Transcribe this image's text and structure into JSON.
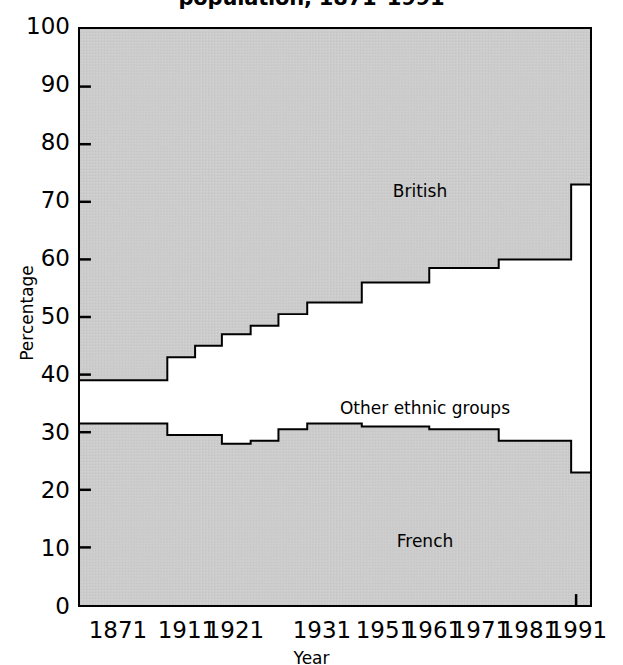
{
  "chart": {
    "title": "population, 1871–1991",
    "y_axis_title": "Percentage",
    "x_axis_title": "Year",
    "y_ticks": [
      "100",
      "90",
      "80",
      "70",
      "60",
      "50",
      "40",
      "30",
      "20",
      "10",
      "0"
    ],
    "x_ticks": [
      "1871",
      "1911",
      "1921",
      "1931",
      "1951",
      "1961",
      "1971",
      "1981",
      "1991"
    ],
    "labels": {
      "british": "British",
      "other": "Other ethnic groups",
      "french": "French"
    },
    "colors": {
      "band_fill": "#cccccc",
      "band_stroke": "#000000",
      "middle_fill": "#ffffff",
      "axis": "#000000",
      "text": "#000000"
    }
  },
  "chart_data": {
    "type": "area",
    "title": "population, 1871–1991",
    "subtitle": "",
    "xlabel": "Year",
    "ylabel": "Percentage",
    "ylim": [
      0,
      100
    ],
    "xlim": [
      1871,
      1991
    ],
    "grid": false,
    "legend_position": "in-plot annotations",
    "stacked": true,
    "step_style": "post",
    "note": "Stacked step area chart of Canadian population by ethnic origin. French band measured from 0 up; British band measured from 100 down; 'Other ethnic groups' is the white remainder between them.",
    "categories": [
      "1871",
      "1881",
      "1891",
      "1901",
      "1911",
      "1921",
      "1931",
      "1941",
      "1951",
      "1961",
      "1971",
      "1981",
      "1991"
    ],
    "series": [
      {
        "name": "French",
        "values": [
          31.5,
          31.5,
          31.5,
          29.5,
          29.5,
          28.0,
          28.5,
          30.5,
          31.5,
          31.0,
          30.5,
          28.5,
          23.0
        ]
      },
      {
        "name": "British",
        "values": [
          61.0,
          61.0,
          61.0,
          57.0,
          55.0,
          53.0,
          51.5,
          49.5,
          47.5,
          44.0,
          41.5,
          40.0,
          27.0
        ]
      },
      {
        "name": "Other ethnic groups",
        "values": [
          7.5,
          7.5,
          7.5,
          13.5,
          15.5,
          19.0,
          20.0,
          20.0,
          21.0,
          25.0,
          28.0,
          31.5,
          50.0
        ]
      }
    ],
    "band_boundaries": {
      "french_top": [
        31.5,
        31.5,
        31.5,
        29.5,
        29.5,
        28.0,
        28.5,
        30.5,
        31.5,
        31.0,
        30.5,
        28.5,
        23.0
      ],
      "british_bottom": [
        39.0,
        39.0,
        39.0,
        43.0,
        45.0,
        47.0,
        48.5,
        50.5,
        52.5,
        56.0,
        58.5,
        60.0,
        73.0
      ]
    }
  }
}
